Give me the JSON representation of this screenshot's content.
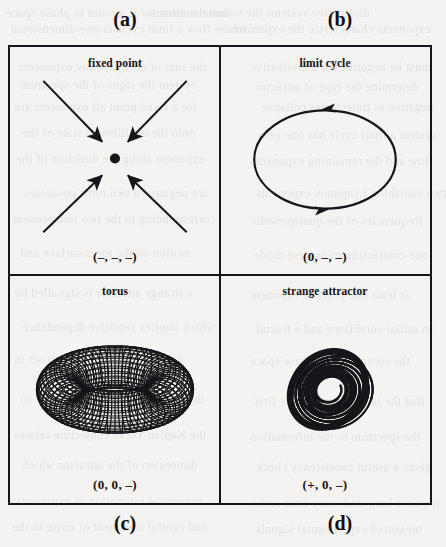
{
  "figure": {
    "background_color": "#f4f3f1",
    "ink_color": "#16161a",
    "captions": [
      {
        "id": "a",
        "text": "(a)"
      },
      {
        "id": "b",
        "text": "(b)"
      },
      {
        "id": "c",
        "text": "(c)"
      },
      {
        "id": "d",
        "text": "(d)"
      }
    ],
    "panels": [
      {
        "id": "a",
        "position": "top-left",
        "title": "fixed point",
        "label": "(–, –, –)",
        "artwork": "converging-arrows-to-point",
        "lyapunov_signs": [
          "-",
          "-",
          "-"
        ],
        "attractor_dimension": 0
      },
      {
        "id": "b",
        "position": "top-right",
        "title": "limit cycle",
        "label": "(0, –, –)",
        "artwork": "ellipse-with-direction-arrows",
        "lyapunov_signs": [
          "0",
          "-",
          "-"
        ],
        "attractor_dimension": 1
      },
      {
        "id": "c",
        "position": "bottom-left",
        "title": "torus",
        "label": "(0, 0, –)",
        "artwork": "wireframe-torus",
        "lyapunov_signs": [
          "0",
          "0",
          "-"
        ],
        "attractor_dimension": 2
      },
      {
        "id": "d",
        "position": "bottom-right",
        "title": "strange attractor",
        "label": "(+, 0, –)",
        "artwork": "chaotic-spiral-attractor",
        "lyapunov_signs": [
          "+",
          "0",
          "-"
        ],
        "attractor_dimension": 3
      }
    ]
  },
  "bleed_text": [
    {
      "x": 6,
      "y": 6,
      "text": "and the attractor is a point in phase space"
    },
    {
      "x": 150,
      "y": 6,
      "text": "dissipative systems the volume contracts"
    },
    {
      "x": 10,
      "y": 22,
      "text": "of the flow  a limit cycle is one-dimensional"
    },
    {
      "x": 230,
      "y": 22,
      "text": "exponents characterize the expansion"
    },
    {
      "x": 18,
      "y": 60,
      "text": "the sum of all Lyapunov exponents"
    },
    {
      "x": 250,
      "y": 60,
      "text": "must be negative for a dissipative"
    },
    {
      "x": 20,
      "y": 78,
      "text": "system  the signs of the spectrum"
    },
    {
      "x": 255,
      "y": 80,
      "text": "determine the type of attractor"
    },
    {
      "x": 14,
      "y": 100,
      "text": "for a fixed point all exponents are"
    },
    {
      "x": 262,
      "y": 100,
      "text": "negative as trajectories collapse"
    },
    {
      "x": 22,
      "y": 126,
      "text": "onto the equilibrium state of the"
    },
    {
      "x": 258,
      "y": 128,
      "text": "system  a limit cycle has one zero"
    },
    {
      "x": 16,
      "y": 152,
      "text": "exponent along the direction of the"
    },
    {
      "x": 250,
      "y": 154,
      "text": "flow  and the remaining exponents"
    },
    {
      "x": 24,
      "y": 186,
      "text": "are negative  a two torus possesses"
    },
    {
      "x": 256,
      "y": 186,
      "text": "two vanishing Lyapunov exponents"
    },
    {
      "x": 12,
      "y": 212,
      "text": "corresponding to the two independent"
    },
    {
      "x": 250,
      "y": 214,
      "text": "frequencies of the quasiperiodic"
    },
    {
      "x": 20,
      "y": 246,
      "text": "motion on the torus surface and"
    },
    {
      "x": 254,
      "y": 248,
      "text": "one contracting transverse mode"
    },
    {
      "x": 14,
      "y": 286,
      "text": "a strange attractor is signalled by"
    },
    {
      "x": 250,
      "y": 288,
      "text": "at least one positive exponent"
    },
    {
      "x": 22,
      "y": 320,
      "text": "which implies sensitive dependence"
    },
    {
      "x": 256,
      "y": 322,
      "text": "on initial conditions and a fractal"
    },
    {
      "x": 14,
      "y": 352,
      "text": "geometry of the invariant set in"
    },
    {
      "x": 250,
      "y": 354,
      "text": "the reconstructed phase space"
    },
    {
      "x": 20,
      "y": 392,
      "text": "the spectrum is usually ordered so"
    },
    {
      "x": 254,
      "y": 394,
      "text": "that the largest exponent is first"
    },
    {
      "x": 14,
      "y": 428,
      "text": "the Kaplan Yorke conjecture relates"
    },
    {
      "x": 250,
      "y": 430,
      "text": "the spectrum to the information"
    },
    {
      "x": 22,
      "y": 458,
      "text": "dimension of the attractor which"
    },
    {
      "x": 256,
      "y": 460,
      "text": "gives a useful consistency check"
    },
    {
      "x": 16,
      "y": 494,
      "text": "numerical estimation of exponents"
    },
    {
      "x": 250,
      "y": 496,
      "text": "requires long stationary time series"
    },
    {
      "x": 12,
      "y": 520,
      "text": "and careful treatment of noise in the"
    },
    {
      "x": 256,
      "y": 522,
      "text": "measured experimental signals"
    }
  ]
}
